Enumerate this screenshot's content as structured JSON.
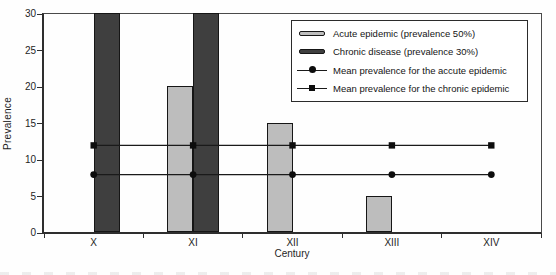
{
  "figure": {
    "background": "#fefefe",
    "text_color": "#1f1f1f",
    "axis_color": "#2e2e2e"
  },
  "chart_data": {
    "type": "bar",
    "title": "",
    "xlabel": "Century",
    "ylabel": "Prevalence",
    "categories": [
      "X",
      "XI",
      "XII",
      "XIII",
      "XIV"
    ],
    "ylim": [
      0,
      30
    ],
    "y_ticks": [
      0,
      5,
      10,
      15,
      20,
      25,
      30
    ],
    "grid": false,
    "legend_position": "top-right-inside",
    "series": [
      {
        "name": "Acute epidemic (prevalence 50%)",
        "kind": "bar",
        "group_slot": 0,
        "color": "#bdbdbd",
        "values": [
          null,
          20,
          15,
          5,
          null
        ]
      },
      {
        "name": "Chronic disease (prevalence 30%)",
        "kind": "bar",
        "group_slot": 1,
        "color": "#3f3f3f",
        "values": [
          30,
          30,
          null,
          null,
          null
        ]
      },
      {
        "name": "Mean prevalence for the accute epidemic",
        "kind": "line",
        "marker": "circle",
        "color": "#1a1a1a",
        "values": [
          8,
          8,
          8,
          8,
          8
        ]
      },
      {
        "name": "Mean prevalence for the chronic epidemic",
        "kind": "line",
        "marker": "square",
        "color": "#1a1a1a",
        "values": [
          12,
          12,
          12,
          12,
          12
        ]
      }
    ]
  }
}
